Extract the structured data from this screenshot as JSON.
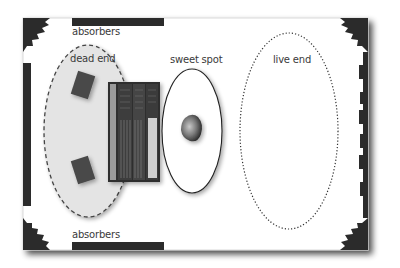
{
  "diagram": {
    "type": "studio-room-acoustics-layout",
    "labels": {
      "absorbers_top": "absorbers",
      "absorbers_bottom": "absorbers",
      "dead_end": "dead end",
      "sweet_spot": "sweet spot",
      "live_end": "live end"
    },
    "zones": [
      {
        "id": "dead-end",
        "label": "dead end",
        "style": "dashed",
        "fill": "#e6e6e6"
      },
      {
        "id": "sweet-spot",
        "label": "sweet spot",
        "style": "solid",
        "fill": "#ffffff"
      },
      {
        "id": "live-end",
        "label": "live end",
        "style": "dotted",
        "fill": "#ffffff"
      }
    ],
    "objects": [
      {
        "id": "speaker-top",
        "kind": "monitor speaker"
      },
      {
        "id": "speaker-bottom",
        "kind": "monitor speaker"
      },
      {
        "id": "mixing-console",
        "kind": "mixing console"
      },
      {
        "id": "listener",
        "kind": "listener head"
      }
    ],
    "room_treatment": {
      "absorbers": [
        "top wall",
        "bottom wall",
        "left wall"
      ],
      "bass_traps": [
        "top-left corner",
        "top-right corner",
        "bottom-left corner",
        "bottom-right corner"
      ],
      "diffuser": "right wall"
    },
    "colors": {
      "wall_dark": "#2b2b2b",
      "room_bg": "#ffffff",
      "dead_end_fill": "#e4e4e4",
      "text": "#3a3a3a"
    }
  }
}
